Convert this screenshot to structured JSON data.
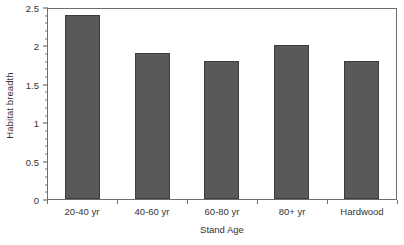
{
  "chart_data": {
    "type": "bar",
    "title": "",
    "xlabel": "Stand Age",
    "ylabel": "Habitat breadth",
    "categories": [
      "20-40 yr",
      "40-60 yr",
      "60-80 yr",
      "80+ yr",
      "Hardwood"
    ],
    "values": [
      2.4,
      1.9,
      1.8,
      2.0,
      1.8
    ],
    "ylim": [
      0,
      2.5
    ],
    "ytick_labels": [
      "0",
      "0.5",
      "1",
      "1.5",
      "2",
      "2.5"
    ],
    "ytick_values": [
      0,
      0.5,
      1,
      1.5,
      2,
      2.5
    ],
    "yminor_step": 0.1,
    "grid": false,
    "legend": false,
    "bar_color": "#595959",
    "bar_edge_color": "#3d3d3d",
    "axis_color": "#6e6e6e",
    "background_color": "#ffffff",
    "text_color": "#333333"
  }
}
